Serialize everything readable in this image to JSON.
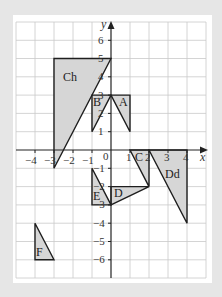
{
  "diagram": {
    "axes": {
      "x_label": "x",
      "y_label": "y",
      "origin_label": "0",
      "x_range": [
        -5,
        5
      ],
      "y_range": [
        -7,
        7
      ],
      "x_tick_labels": [
        "−4",
        "−3",
        "−2",
        "−1",
        "1",
        "2",
        "3",
        "4"
      ],
      "y_tick_labels_pos": [
        "6",
        "5",
        "4",
        "3",
        "2",
        "1"
      ],
      "y_tick_labels_neg": [
        "−1",
        "−2",
        "−3",
        "−4",
        "−5",
        "−6"
      ]
    },
    "shapes": [
      {
        "label": "Ch",
        "vertices": [
          [
            -3,
            5
          ],
          [
            0,
            5
          ],
          [
            -3,
            -1
          ]
        ]
      },
      {
        "label": "B",
        "vertices": [
          [
            -1,
            3
          ],
          [
            0,
            3
          ],
          [
            -1,
            1
          ]
        ]
      },
      {
        "label": "A",
        "vertices": [
          [
            0,
            3
          ],
          [
            1,
            3
          ],
          [
            1,
            1
          ]
        ]
      },
      {
        "label": "C",
        "vertices": [
          [
            1,
            0
          ],
          [
            2,
            0
          ],
          [
            2,
            -2
          ]
        ]
      },
      {
        "label": "Dd",
        "vertices": [
          [
            2,
            0
          ],
          [
            4,
            0
          ],
          [
            4,
            -4
          ]
        ]
      },
      {
        "label": "D",
        "vertices": [
          [
            0,
            -2
          ],
          [
            2,
            -2
          ],
          [
            0,
            -3
          ]
        ]
      },
      {
        "label": "E",
        "vertices": [
          [
            -1,
            -1
          ],
          [
            -1,
            -3
          ],
          [
            0,
            -3
          ]
        ]
      },
      {
        "label": "F",
        "vertices": [
          [
            -4,
            -3
          ],
          [
            -4,
            -5
          ],
          [
            -3,
            -5
          ]
        ]
      }
    ],
    "colors": {
      "background": "#e6e6e6",
      "panel": "#ffffff",
      "grid": "#c9c9c9",
      "shape_fill": "#d6d6d6",
      "outline": "#1e1e1e"
    }
  }
}
